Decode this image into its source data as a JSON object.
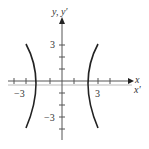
{
  "figure": {
    "type": "hyperbola-graph",
    "axes": {
      "y_label": "y, y′",
      "x_label": "x",
      "x_prime_label": "x′",
      "x_tick_labels": [
        "−3",
        "3"
      ],
      "y_tick_labels": [
        "3",
        "−3"
      ]
    },
    "curve": {
      "description": "hyperbola opening left and right",
      "vertices": [
        -2,
        2
      ],
      "color": "#222222"
    }
  }
}
